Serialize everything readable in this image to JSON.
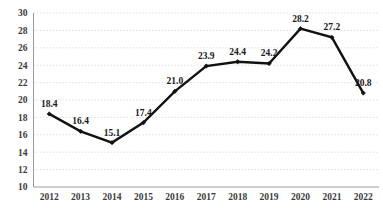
{
  "chart_data": {
    "type": "line",
    "title": "",
    "subtitle": "",
    "xlabel": "",
    "ylabel": "",
    "categories": [
      "2012",
      "2013",
      "2014",
      "2015",
      "2016",
      "2017",
      "2018",
      "2019",
      "2020",
      "2021",
      "2022"
    ],
    "values": [
      18.4,
      16.4,
      15.1,
      17.4,
      21.0,
      23.9,
      24.4,
      24.2,
      28.2,
      27.2,
      20.8
    ],
    "data_labels": [
      "18.4",
      "16.4",
      "15.1",
      "17.4",
      "21.0",
      "23.9",
      "24.4",
      "24.2",
      "28.2",
      "27.2",
      "20.8"
    ],
    "ylim": [
      10,
      30
    ],
    "ytick_step": 2,
    "ytick_labels": [
      "30",
      "28",
      "26",
      "24",
      "22",
      "20",
      "18",
      "16",
      "14",
      "12",
      "10"
    ],
    "grid": "horizontal-dotted",
    "legend": "none",
    "series_color": "#121212",
    "grid_color": "#d9d9e0",
    "axis_color": "#9a9a9a",
    "label_color": "#1a1a1a",
    "tick_color": "#3a3a3a",
    "background": "#ffffff",
    "marker": "diamond"
  }
}
